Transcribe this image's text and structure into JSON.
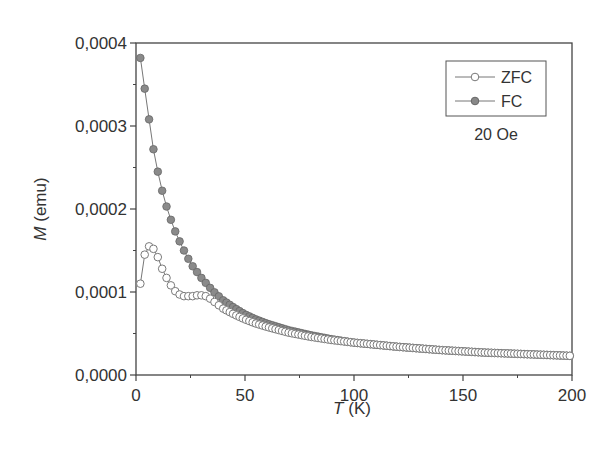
{
  "chart_data": {
    "type": "scatter",
    "title": "",
    "xlabel": "T (K)",
    "xlabel_var": "T",
    "xlabel_unit": " (K)",
    "ylabel": "M (emu)",
    "ylabel_var": "M",
    "ylabel_unit": " (emu)",
    "xlim": [
      0,
      200
    ],
    "ylim": [
      0,
      0.0004
    ],
    "xticks": [
      0,
      50,
      100,
      150,
      200
    ],
    "xtick_labels": [
      "0",
      "50",
      "100",
      "150",
      "200"
    ],
    "yticks": [
      0,
      0.0001,
      0.0002,
      0.0003,
      0.0004
    ],
    "ytick_labels": [
      "0,0000",
      "0,0001",
      "0,0002",
      "0,0003",
      "0,0004"
    ],
    "grid": false,
    "legend_position": "upper right",
    "annotation": "20 Oe",
    "series": [
      {
        "name": "ZFC",
        "marker": "open-circle",
        "color": "#888888",
        "x": [
          2,
          4,
          6,
          8,
          10,
          12,
          14,
          16,
          18,
          20,
          22,
          24,
          26,
          28,
          30,
          32,
          34,
          36,
          38,
          40,
          45,
          50,
          55,
          60,
          70,
          80,
          90,
          100,
          120,
          140,
          160,
          180,
          200
        ],
        "y": [
          0.00011,
          0.000145,
          0.000155,
          0.000152,
          0.000142,
          0.000128,
          0.000117,
          0.000108,
          0.000101,
          9.7e-05,
          9.5e-05,
          9.5e-05,
          9.5e-05,
          9.6e-05,
          9.6e-05,
          9.5e-05,
          9.2e-05,
          8.8e-05,
          8.4e-05,
          8e-05,
          7.3e-05,
          6.7e-05,
          6.2e-05,
          5.8e-05,
          5.1e-05,
          4.6e-05,
          4.2e-05,
          3.9e-05,
          3.4e-05,
          3e-05,
          2.7e-05,
          2.5e-05,
          2.3e-05
        ]
      },
      {
        "name": "FC",
        "marker": "filled-circle",
        "color": "#7a7a7a",
        "x": [
          2,
          4,
          6,
          8,
          10,
          12,
          14,
          16,
          18,
          20,
          22,
          24,
          26,
          28,
          30,
          35,
          40,
          45,
          50,
          55,
          60,
          70,
          80,
          90,
          100,
          120,
          140,
          160,
          180,
          200
        ],
        "y": [
          0.000382,
          0.000345,
          0.000308,
          0.000272,
          0.000245,
          0.000222,
          0.000203,
          0.000187,
          0.000173,
          0.000161,
          0.00015,
          0.00014,
          0.000131,
          0.000124,
          0.000117,
          0.000102,
          9e-05,
          8.1e-05,
          7.3e-05,
          6.7e-05,
          6.2e-05,
          5.4e-05,
          4.8e-05,
          4.3e-05,
          3.9e-05,
          3.4e-05,
          3e-05,
          2.7e-05,
          2.5e-05,
          2.3e-05
        ]
      }
    ]
  }
}
